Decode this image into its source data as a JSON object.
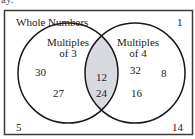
{
  "cut_text": "ay.",
  "diagram": {
    "type": "venn",
    "universe_label": "Whole Numbers",
    "sets": [
      {
        "label_line1": "Multiples",
        "label_line2": "of 3",
        "only": [
          "30",
          "27"
        ]
      },
      {
        "label_line1": "Multiples",
        "label_line2": "of 4",
        "only": [
          "32",
          "8",
          "16"
        ]
      }
    ],
    "intersection": [
      "12",
      "24"
    ],
    "outside": [
      "1",
      "5",
      "14"
    ],
    "colors": {
      "stroke": "#1a1a1a",
      "intersection_fill": "#d9d9e0",
      "background": "#ffffff"
    }
  }
}
